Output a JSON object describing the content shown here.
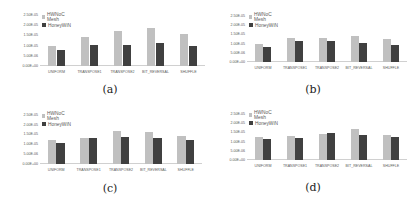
{
  "chart_data": [
    {
      "id": "a",
      "type": "bar",
      "caption": "(a)",
      "categories": [
        "UNIFORM",
        "TRANSPOSE1",
        "TRANSPOSE2",
        "BIT_REVERSAL",
        "SHUFFLE"
      ],
      "series": [
        {
          "name": "HWNoC Mesh",
          "color": "#c0c0c0",
          "values": [
            1e-05,
            1.4e-05,
            1.7e-05,
            1.85e-05,
            1.55e-05
          ]
        },
        {
          "name": "HoneyWiN",
          "color": "#404040",
          "values": [
            8e-06,
            1.05e-05,
            1.05e-05,
            1.15e-05,
            1e-05
          ]
        }
      ],
      "yticks": [
        "2.50E-05",
        "2.00E-05",
        "1.50E-05",
        "1.00E-05",
        "5.00E-06",
        "0.00E+00"
      ],
      "ylim": [
        0,
        2.5e-05
      ],
      "xlabel": "",
      "ylabel": "",
      "legend_position": "top-left",
      "grid": false
    },
    {
      "id": "b",
      "type": "bar",
      "caption": "(b)",
      "categories": [
        "UNIFORM",
        "TRANSPOSE1",
        "TRANSPOSE2",
        "BIT_REVERSAL",
        "SHUFFLE"
      ],
      "series": [
        {
          "name": "HWNoC Mesh",
          "color": "#c0c0c0",
          "values": [
            9.75e-06,
            1.28e-05,
            1.3e-05,
            1.41e-05,
            1.27e-05
          ]
        },
        {
          "name": "HoneyWiN",
          "color": "#404040",
          "values": [
            8.25e-06,
            1.14e-05,
            1.14e-05,
            1.06e-05,
            9e-06
          ]
        }
      ],
      "yticks": [
        "2.50E-05",
        "2.00E-05",
        "1.50E-05",
        "1.00E-05",
        "5.00E-06",
        "0.00E+00"
      ],
      "ylim": [
        0,
        2.5e-05
      ],
      "xlabel": "",
      "ylabel": "",
      "legend_position": "top-left",
      "grid": false
    },
    {
      "id": "c",
      "type": "bar",
      "caption": "(c)",
      "categories": [
        "UNIFORM",
        "TRANSPOSE1",
        "TRANSPOSE2",
        "BIT_REVERSAL",
        "SHUFFLE"
      ],
      "series": [
        {
          "name": "HWNoC Mesh",
          "color": "#c0c0c0",
          "values": [
            1.21e-05,
            1.3e-05,
            1.66e-05,
            1.6e-05,
            1.4e-05
          ]
        },
        {
          "name": "HoneyWiN",
          "color": "#404040",
          "values": [
            1.06e-05,
            1.32e-05,
            1.37e-05,
            1.3e-05,
            1.21e-05
          ]
        }
      ],
      "yticks": [
        "2.50E-05",
        "2.00E-05",
        "1.50E-05",
        "1.00E-05",
        "5.00E-06",
        "0.00E+00"
      ],
      "ylim": [
        0,
        2.5e-05
      ],
      "xlabel": "",
      "ylabel": "",
      "legend_position": "top-left",
      "grid": false
    },
    {
      "id": "d",
      "type": "bar",
      "caption": "(d)",
      "categories": [
        "UNIFORM",
        "TRANSPOSE1",
        "TRANSPOSE2",
        "BIT_REVERSAL",
        "SHUFFLE"
      ],
      "series": [
        {
          "name": "HWNoC Mesh",
          "color": "#c0c0c0",
          "values": [
            1.27e-05,
            1.32e-05,
            1.43e-05,
            1.69e-05,
            1.36e-05
          ]
        },
        {
          "name": "HoneyWiN",
          "color": "#404040",
          "values": [
            1.12e-05,
            1.19e-05,
            1.45e-05,
            1.38e-05,
            1.23e-05
          ]
        }
      ],
      "yticks": [
        "2.50E-05",
        "2.00E-05",
        "1.50E-05",
        "1.00E-05",
        "5.00E-06",
        "0.00E+00"
      ],
      "ylim": [
        0,
        2.5e-05
      ],
      "xlabel": "",
      "ylabel": "",
      "legend_position": "top-left",
      "grid": false
    }
  ],
  "layout": [
    {
      "ylabels": {
        "left": 14,
        "top": 15,
        "width": 24,
        "height": 51
      },
      "plot": {
        "left": 40,
        "top": 15,
        "width": 165,
        "height": 51
      },
      "legend": {
        "left": 42,
        "top": 13
      },
      "caption": {
        "x": 110,
        "y": 83
      }
    },
    {
      "ylabels": {
        "left": 221,
        "top": 16,
        "width": 24,
        "height": 46
      },
      "plot": {
        "left": 247,
        "top": 16,
        "width": 160,
        "height": 46
      },
      "legend": {
        "left": 249,
        "top": 13
      },
      "caption": {
        "x": 313,
        "y": 83
      }
    },
    {
      "ylabels": {
        "left": 14,
        "top": 115,
        "width": 24,
        "height": 48.5
      },
      "plot": {
        "left": 40,
        "top": 115,
        "width": 162,
        "height": 48.5
      },
      "legend": {
        "left": 42,
        "top": 112
      },
      "caption": {
        "x": 110,
        "y": 182
      }
    },
    {
      "ylabels": {
        "left": 221,
        "top": 114,
        "width": 24,
        "height": 46
      },
      "plot": {
        "left": 247,
        "top": 114,
        "width": 160,
        "height": 46
      },
      "legend": {
        "left": 249,
        "top": 111
      },
      "caption": {
        "x": 313,
        "y": 181
      }
    }
  ]
}
